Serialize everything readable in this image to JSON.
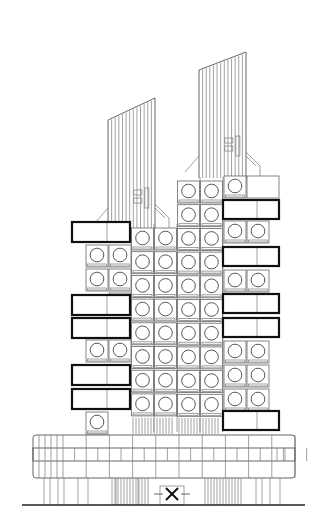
{
  "drawing": {
    "title": "Capsule tower front elevation",
    "subject": "Two-core capsule tower with stacked square capsules, circular windows, rooftop masts and a podium base",
    "colors": {
      "background": "#ffffff",
      "line": "#666666",
      "accent_line": "#111111"
    },
    "masts": [
      {
        "name": "left-mast",
        "x": 108,
        "w": 47,
        "top_left": 120,
        "top_right": 98,
        "bottom": 230,
        "ribs": 13
      },
      {
        "name": "right-mast",
        "x": 199,
        "w": 47,
        "top_left": 70,
        "top_right": 52,
        "bottom": 178,
        "ribs": 13
      }
    ],
    "core_columns": [
      {
        "name": "left-core",
        "cols": [
          131,
          154
        ],
        "top": 228,
        "rows": 8
      },
      {
        "name": "right-core",
        "cols": [
          177,
          200
        ],
        "top": 181,
        "rows": 10
      }
    ],
    "outer_left": {
      "capsules": [
        {
          "x": 86,
          "y": 245
        },
        {
          "x": 109,
          "y": 245
        },
        {
          "x": 86,
          "y": 269
        },
        {
          "x": 109,
          "y": 269
        },
        {
          "x": 109,
          "y": 293
        },
        {
          "x": 86,
          "y": 340
        },
        {
          "x": 109,
          "y": 340
        },
        {
          "x": 86,
          "y": 412
        }
      ],
      "bold_units": [
        {
          "x": 72,
          "y": 222,
          "w": 58,
          "h": 20,
          "div": 107
        },
        {
          "x": 72,
          "y": 295,
          "w": 58,
          "h": 20,
          "div": 107
        },
        {
          "x": 72,
          "y": 318,
          "w": 58,
          "h": 20,
          "div": 107
        },
        {
          "x": 72,
          "y": 365,
          "w": 58,
          "h": 20,
          "div": 107
        },
        {
          "x": 72,
          "y": 389,
          "w": 58,
          "h": 20,
          "div": 107
        }
      ]
    },
    "outer_right": {
      "capsules": [
        {
          "x": 224,
          "y": 176
        },
        {
          "x": 224,
          "y": 221
        },
        {
          "x": 247,
          "y": 221
        },
        {
          "x": 224,
          "y": 270
        },
        {
          "x": 247,
          "y": 270
        },
        {
          "x": 224,
          "y": 341
        },
        {
          "x": 247,
          "y": 341
        },
        {
          "x": 224,
          "y": 365
        },
        {
          "x": 247,
          "y": 365
        },
        {
          "x": 224,
          "y": 389
        },
        {
          "x": 247,
          "y": 389
        }
      ],
      "plain_unit": {
        "x": 247,
        "y": 176,
        "w": 32,
        "h": 22
      },
      "bold_units": [
        {
          "x": 223,
          "y": 200,
          "w": 56,
          "h": 19,
          "div": 257
        },
        {
          "x": 223,
          "y": 247,
          "w": 56,
          "h": 19,
          "div": 257
        },
        {
          "x": 223,
          "y": 294,
          "w": 56,
          "h": 19,
          "div": 257
        },
        {
          "x": 223,
          "y": 318,
          "w": 56,
          "h": 19,
          "div": 257
        },
        {
          "x": 223,
          "y": 411,
          "w": 56,
          "h": 19,
          "div": 257
        }
      ]
    },
    "podium": {
      "x": 33,
      "y": 435,
      "w": 262,
      "h": 43,
      "band_y": 448,
      "band_h": 13,
      "bays": 12
    },
    "entrance": {
      "symbol": "X",
      "x": 172,
      "y": 494
    },
    "ground_line_y": 505
  }
}
